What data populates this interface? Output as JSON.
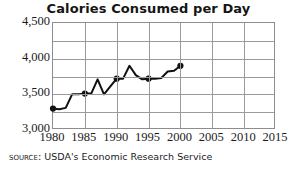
{
  "chart_data": {
    "type": "line",
    "title": "Calories Consumed per Day",
    "xlabel": "",
    "ylabel": "",
    "xlim": [
      1980,
      2015
    ],
    "ylim": [
      3000,
      4500
    ],
    "grid": true,
    "legend": null,
    "y_ticks": [
      "3,000",
      "3,500",
      "4,000",
      "4,500"
    ],
    "y_tick_values": [
      3000,
      3500,
      4000,
      4500
    ],
    "y_minor_step": 250,
    "x_ticks": [
      "1980",
      "1985",
      "1990",
      "1995",
      "2000",
      "2005",
      "2010",
      "2015"
    ],
    "x_tick_values": [
      1980,
      1985,
      1990,
      1995,
      2000,
      2005,
      2010,
      2015
    ],
    "series": [
      {
        "name": "Calories consumed per day",
        "color": "#111111",
        "marker_years": [
          1980,
          1985,
          1990,
          1995,
          2000
        ],
        "x": [
          1980,
          1981,
          1982,
          1983,
          1984,
          1985,
          1986,
          1987,
          1988,
          1989,
          1990,
          1991,
          1992,
          1993,
          1994,
          1995,
          1996,
          1997,
          1998,
          1999,
          2000
        ],
        "values": [
          3300,
          3290,
          3310,
          3500,
          3500,
          3510,
          3510,
          3710,
          3500,
          3610,
          3720,
          3720,
          3900,
          3770,
          3710,
          3720,
          3720,
          3730,
          3820,
          3830,
          3900
        ]
      }
    ]
  },
  "source": {
    "label": "Source:",
    "text": "USDA's Economic Research Service"
  }
}
